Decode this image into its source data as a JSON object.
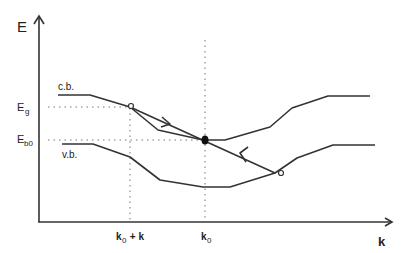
{
  "diagram": {
    "type": "energy band diagram (E vs k)",
    "axes": {
      "y_label": "E",
      "x_label": "k"
    },
    "curves": {
      "conduction_band_label": "c.b.",
      "valence_band_label": "v.b."
    },
    "y_ticks": {
      "eg_main": "E",
      "eg_sub": "g",
      "eb0_main": "E",
      "eb0_sub": "b0"
    },
    "x_ticks": {
      "k0_plus_k_main": "k",
      "k0_plus_k_sub": "0",
      "k0_plus_k_rest": " + k",
      "k0_main": "k",
      "k0_sub": "0"
    },
    "markers": {
      "open_circle_upper": "c.b. at k0 + k",
      "open_circle_lower": "v.b. transition end",
      "filled_dot": "crossing at k0, Eb0"
    },
    "colors": {
      "line": "#333333",
      "guide": "#777777",
      "background": "#ffffff"
    }
  }
}
